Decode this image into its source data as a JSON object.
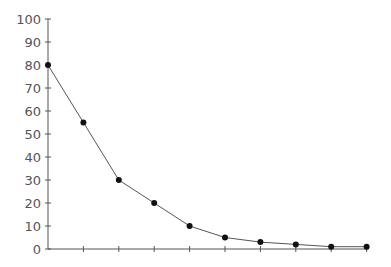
{
  "chart_data": {
    "type": "line",
    "title": "",
    "xlabel": "",
    "ylabel": "",
    "x": [
      1,
      2,
      3,
      4,
      5,
      6,
      7,
      8,
      9,
      10
    ],
    "series": [
      {
        "name": "series-1",
        "values": [
          80,
          55,
          30,
          20,
          10,
          5,
          3,
          2,
          1,
          1
        ]
      }
    ],
    "ylim": [
      0,
      100
    ],
    "yticks": [
      0,
      10,
      20,
      30,
      40,
      50,
      60,
      70,
      80,
      90,
      100
    ],
    "xtick_labels": [],
    "grid": false,
    "legend": "none",
    "colors": {
      "line": "#555555",
      "marker": "#111111",
      "axis": "#555555",
      "text": "#555555"
    }
  }
}
